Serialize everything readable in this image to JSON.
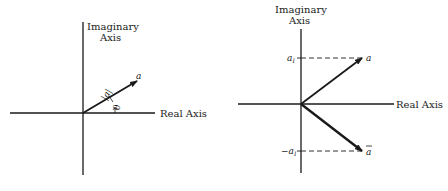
{
  "left_diagram": {
    "imag_axis_label_line1": "Imaginary",
    "imag_axis_label_line2": "Axis",
    "real_axis_label": "Real Axis",
    "vector_label": "a",
    "magnitude_label": "|a|",
    "angle_label": "θ"
  },
  "right_diagram": {
    "imag_axis_label_line1": "Imaginary",
    "imag_axis_label_line2": "Axis",
    "real_axis_label": "Real Axis",
    "vector_label": "a",
    "conjugate_label": "a",
    "pos_imag_label": "a",
    "pos_imag_sub": "I",
    "neg_imag_label": "−a",
    "neg_imag_sub": "I"
  },
  "colors": {
    "ink": "#1a1a1a",
    "background": "#ffffff"
  }
}
